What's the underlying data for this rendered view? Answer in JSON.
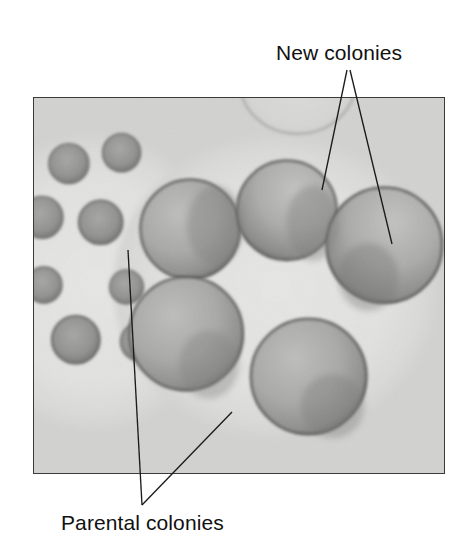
{
  "figure": {
    "width": 468,
    "height": 539,
    "background_color": "#ffffff",
    "type": "annotated-photomicrograph"
  },
  "annotations": [
    {
      "id": "new-colonies",
      "label": "New colonies",
      "text_color": "#111111",
      "font_size_px": 21,
      "position": {
        "left": 276,
        "top": 41
      },
      "leader_lines": [
        {
          "x1": 347,
          "y1": 70,
          "x2": 322,
          "y2": 190
        },
        {
          "x1": 350,
          "y1": 70,
          "x2": 392,
          "y2": 244
        }
      ]
    },
    {
      "id": "parental-colonies",
      "label": "Parental colonies",
      "text_color": "#111111",
      "font_size_px": 21,
      "position": {
        "left": 61,
        "top": 511
      },
      "leader_lines": [
        {
          "x1": 142,
          "y1": 505,
          "x2": 128,
          "y2": 250
        },
        {
          "x1": 142,
          "y1": 505,
          "x2": 232,
          "y2": 412
        }
      ]
    }
  ],
  "photo": {
    "frame": {
      "left": 33,
      "top": 97,
      "width": 412,
      "height": 377
    },
    "border_color": "#3a3a3a",
    "background_color": "#d7d7d6",
    "media_color": "#d2d2d1",
    "colony_edge_color": "#5d5d5d",
    "colony_fill_color": "#a9a9a8",
    "swarm_halo_color": "#e2e2e1",
    "regions": [
      {
        "name": "parental-colony-lobe",
        "description": "left pale lobe containing many small dark parental colonies",
        "center": {
          "cx": 60,
          "cy": 185
        },
        "radius": 135
      },
      {
        "name": "giant-colony-lobe",
        "description": "right pale swarm lobe containing the large new colonies",
        "center": {
          "cx": 240,
          "cy": 185
        },
        "radius": 160
      }
    ],
    "parental_colonies": [
      {
        "cx": 35,
        "cy": 66,
        "r": 20
      },
      {
        "cx": 88,
        "cy": 55,
        "r": 19
      },
      {
        "cx": 8,
        "cy": 120,
        "r": 21
      },
      {
        "cx": 67,
        "cy": 125,
        "r": 22
      },
      {
        "cx": 10,
        "cy": 188,
        "r": 18
      },
      {
        "cx": 93,
        "cy": 190,
        "r": 17
      },
      {
        "cx": 42,
        "cy": 243,
        "r": 24
      },
      {
        "cx": 106,
        "cy": 245,
        "r": 19
      }
    ],
    "new_colonies": [
      {
        "cx": 157,
        "cy": 132,
        "r": 50,
        "label_target": false
      },
      {
        "cx": 254,
        "cy": 113,
        "r": 50,
        "label_target": true
      },
      {
        "cx": 352,
        "cy": 148,
        "r": 58,
        "label_target": true
      },
      {
        "cx": 153,
        "cy": 237,
        "r": 57,
        "label_target": false
      },
      {
        "cx": 276,
        "cy": 280,
        "r": 58,
        "label_target": false
      }
    ],
    "partial_colony": {
      "cx": 265,
      "cy": -18,
      "r": 58
    }
  }
}
